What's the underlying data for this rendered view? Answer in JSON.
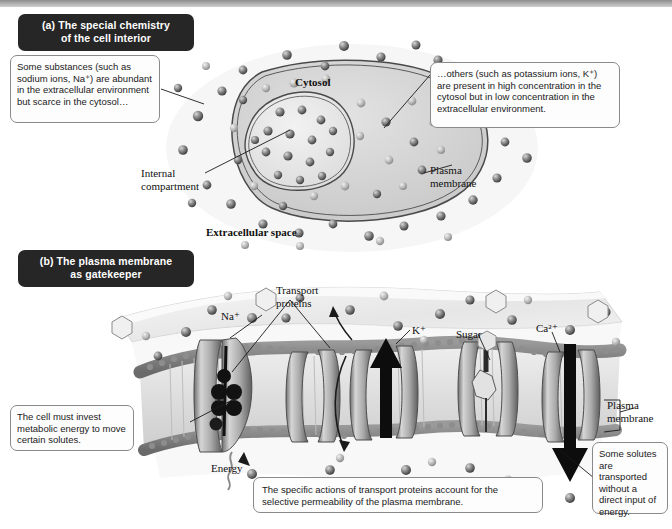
{
  "figure": {
    "style": "grayscale textbook illustration"
  },
  "panel_a": {
    "plaque_label": "(a) The special chemistry",
    "plaque_label_line2": "of the cell interior",
    "plaque_prefix": "(a)",
    "callout_left": "Some substances (such as sodium ions, Na⁺) are abundant in the extracellular environment but scarce in the cytosol…",
    "callout_right": "…others (such as potassium ions, K⁺) are present in high concentration in the cytosol but in low concentration in the extracellular environment.",
    "labels": {
      "cytosol": "Cytosol",
      "internal_compartment": "Internal compartment",
      "plasma_membrane": "Plasma membrane",
      "extracellular_space": "Extracellular space"
    }
  },
  "panel_b": {
    "plaque_label": "(b) The plasma membrane",
    "plaque_label_line2": "as gatekeeper",
    "plaque_prefix": "(b)",
    "callout_left": "The cell must invest metabolic energy to move certain solutes.",
    "callout_right": "Some solutes are transported without a direct input of energy.",
    "callout_bottom": "The specific actions of transport proteins account for the selective permeability of the plasma membrane.",
    "labels": {
      "transport_proteins": "Transport proteins",
      "sodium": "Na⁺",
      "potassium": "K⁺",
      "sugar": "Sugar",
      "calcium": "Ca²⁺",
      "energy": "Energy",
      "plasma_membrane": "Plasma membrane"
    }
  },
  "colors": {
    "plaque_bg": "#262626",
    "plaque_text": "#ffffff",
    "callout_border": "#8a8a8a",
    "ink": "#1a1a1a",
    "membrane_head": "#777777",
    "protein_fill": "#bdbdbd",
    "arrow_black": "#0d0d0d"
  }
}
